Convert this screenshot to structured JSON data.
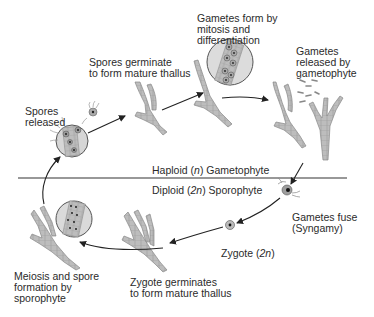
{
  "diagram": {
    "type": "life-cycle",
    "divider": {
      "upper_label": "Haploid (n) Gametophyte",
      "lower_label": "Diploid (2n) Sporophyte",
      "upper_parts": [
        "Haploid (",
        "n",
        ") Gametophyte"
      ],
      "lower_parts": [
        "Diploid (",
        "2n",
        ") Sporophyte"
      ]
    },
    "stages": [
      {
        "id": "spores-released",
        "label": "Spores\nreleased"
      },
      {
        "id": "spores-germinate",
        "label": "Spores germinate\nto form mature thallus"
      },
      {
        "id": "gametes-form",
        "label": "Gametes form by\nmitosis and\ndifferentiation"
      },
      {
        "id": "gametes-released",
        "label": "Gametes\nreleased by\ngametophyte"
      },
      {
        "id": "gametes-fuse",
        "label": "Gametes fuse\n(Syngamy)"
      },
      {
        "id": "zygote",
        "label": "Zygote (2n)",
        "parts": [
          "Zygote (",
          "2n",
          ")"
        ]
      },
      {
        "id": "zygote-germinates",
        "label": "Zygote germinates\nto form mature thallus"
      },
      {
        "id": "meiosis",
        "label": "Meiosis and spore\nformation by\nsporophyte"
      }
    ],
    "cycle_order": [
      "meiosis",
      "spores-released",
      "spores-germinate",
      "gametes-form",
      "gametes-released",
      "gametes-fuse",
      "zygote",
      "zygote-germinates",
      "meiosis"
    ],
    "colors": {
      "thallus_fill": "#b9b9b9",
      "thallus_stroke": "#8a8a8a",
      "circle_fill": "#d9d9d9",
      "arrow": "#222222",
      "text": "#2b2b2b"
    }
  }
}
